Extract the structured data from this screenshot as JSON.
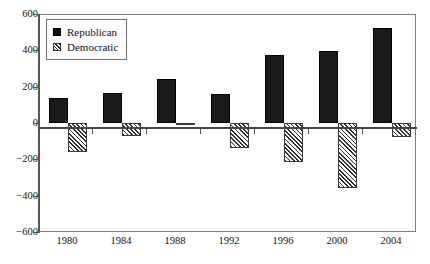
{
  "chart_data": {
    "type": "bar",
    "title": "",
    "subtitle": "",
    "xlabel": "",
    "ylabel": "",
    "categories": [
      "1980",
      "1984",
      "1988",
      "1992",
      "1996",
      "2000",
      "2004"
    ],
    "series": [
      {
        "name": "Republican",
        "values": [
          135,
          165,
          240,
          162,
          372,
          395,
          525
        ]
      },
      {
        "name": "Democratic",
        "values": [
          -160,
          -70,
          -10,
          -135,
          -215,
          -360,
          -75
        ]
      }
    ],
    "ylim": [
      -600,
      600
    ],
    "yticks": [
      600,
      400,
      200,
      0,
      -200,
      -400,
      -600
    ],
    "ytick_labels": [
      "600",
      "400",
      "200",
      "0",
      "−200",
      "−400",
      "−600"
    ],
    "grid": false,
    "legend_position": "upper-left",
    "legend": [
      {
        "label": "Republican",
        "swatch": "solid-black-square"
      },
      {
        "label": "Democratic",
        "swatch": "hatched-square"
      }
    ]
  },
  "colors": {
    "republican": "#1a1a1a",
    "democratic_hatch": "#2e2e2e",
    "axis": "#555555",
    "frame": "#7a7a7a",
    "background": "#ffffff",
    "text": "#111111"
  }
}
